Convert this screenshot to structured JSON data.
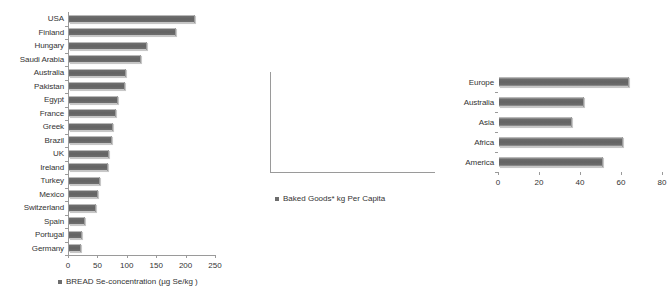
{
  "chart_data": [
    {
      "id": "bread-se-concentration",
      "type": "bar",
      "orientation": "horizontal",
      "title": "",
      "xlabel": "",
      "ylabel": "",
      "legend": "BREAD Se-concentration  (µg Se/kg )",
      "legend_position": "bottom",
      "grid": false,
      "xlim": [
        0,
        250
      ],
      "xticks": [
        0,
        50,
        100,
        150,
        200,
        250
      ],
      "xtick_labels": [
        "0",
        "50",
        "100",
        "150",
        "200",
        "250"
      ],
      "categories": [
        "USA",
        "Finland",
        "Hungary",
        "Saudi Arabia",
        "Australia",
        "Pakistan",
        "Egypt",
        "France",
        "Greek",
        "Brazil",
        "UK",
        "Ireland",
        "Turkey",
        "Mexico",
        "Switzerland",
        "Spain",
        "Portugal",
        "Germany"
      ],
      "values": [
        212,
        180,
        131,
        120,
        95,
        93,
        82,
        78,
        73,
        72,
        67,
        65,
        51,
        47,
        44,
        26,
        21,
        18
      ],
      "series": [
        {
          "name": "BREAD Se-concentration  (µg Se/kg )",
          "values": [
            212,
            180,
            131,
            120,
            95,
            93,
            82,
            78,
            73,
            72,
            67,
            65,
            51,
            47,
            44,
            26,
            21,
            18
          ]
        }
      ]
    },
    {
      "id": "baked-goods-per-capita",
      "type": "bar",
      "orientation": "horizontal",
      "title": "",
      "xlabel": "",
      "ylabel": "",
      "legend": "Baked Goods* kg Per Capita",
      "legend_position": "bottom",
      "grid": false,
      "xlim": [
        0,
        80
      ],
      "xticks": [
        0,
        20,
        40,
        60,
        80
      ],
      "xtick_labels": [
        "0",
        "20",
        "40",
        "60",
        "80"
      ],
      "categories": [
        "Europe",
        "Australia",
        "Asia",
        "Africa",
        "America"
      ],
      "values": [
        63,
        41,
        35,
        60,
        50
      ],
      "series": [
        {
          "name": "Baked Goods* kg Per Capita",
          "values": [
            63,
            41,
            35,
            60,
            50
          ]
        }
      ]
    }
  ],
  "colors": {
    "bar_fill": "#636363",
    "bar_highlight": "#b9b9b9",
    "axis": "#9a9a9a",
    "text": "#333333",
    "background": "#ffffff"
  }
}
